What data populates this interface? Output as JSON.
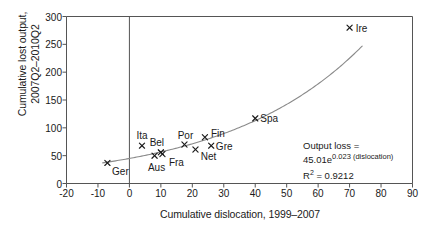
{
  "chart_data": {
    "type": "scatter",
    "title": "",
    "xlabel": "Cumulative dislocation, 1999–2007",
    "ylabel": "Cumulative lost output,\n2007Q2–2010Q2",
    "xlim": [
      -20,
      90
    ],
    "ylim": [
      0,
      300
    ],
    "xticks": [
      "-20",
      "-10",
      "0",
      "10",
      "20",
      "30",
      "40",
      "50",
      "60",
      "70",
      "80",
      "90"
    ],
    "xtick_values": [
      -20,
      -10,
      0,
      10,
      20,
      30,
      40,
      50,
      60,
      70,
      80,
      90
    ],
    "yticks": [
      "0",
      "50",
      "100",
      "150",
      "200",
      "250",
      "300"
    ],
    "ytick_values": [
      0,
      50,
      100,
      150,
      200,
      250,
      300
    ],
    "grid": false,
    "legend": "none",
    "marker": "x",
    "points": [
      {
        "label": "Ger",
        "x": -7.0,
        "y": 37,
        "label_dx": 13,
        "label_dy": 8
      },
      {
        "label": "Ita",
        "x": 4.0,
        "y": 68,
        "label_dx": 0,
        "label_dy": -11
      },
      {
        "label": "Aus",
        "x": 8.0,
        "y": 50,
        "label_dx": 2,
        "label_dy": 11
      },
      {
        "label": "Bel",
        "x": 10.0,
        "y": 56,
        "label_dx": -4,
        "label_dy": -10
      },
      {
        "label": "Fra",
        "x": 10.5,
        "y": 53,
        "label_dx": 14,
        "label_dy": 8
      },
      {
        "label": "Por",
        "x": 17.5,
        "y": 70,
        "label_dx": 1,
        "label_dy": -10
      },
      {
        "label": "Net",
        "x": 21.0,
        "y": 61,
        "label_dx": 13,
        "label_dy": 6
      },
      {
        "label": "Fin",
        "x": 24.0,
        "y": 83,
        "label_dx": 13,
        "label_dy": -4
      },
      {
        "label": "Gre",
        "x": 26.0,
        "y": 68,
        "label_dx": 13,
        "label_dy": 0
      },
      {
        "label": "Spa",
        "x": 40.0,
        "y": 117,
        "label_dx": 14,
        "label_dy": 0
      },
      {
        "label": "Ire",
        "x": 70.0,
        "y": 280,
        "label_dx": 12,
        "label_dy": 0
      }
    ],
    "fit_curve": {
      "kind": "exponential",
      "coefficient": 45.01,
      "exponent_rate": 0.023,
      "r_squared": 0.9212,
      "x_start": -8.5,
      "x_end": 74.0
    },
    "annotation": {
      "line1": "Output loss =",
      "line2_prefix": "45.01e",
      "line2_exponent": "0.023 (dislocation)",
      "r2_label": "R",
      "r2_sup": "2",
      "r2_value": "= 0.9212"
    },
    "colors": {
      "axis": "#555555",
      "curve": "#8a8a8a",
      "marker": "#1a1a1a",
      "text": "#1a1a1a",
      "background": "#ffffff"
    }
  }
}
